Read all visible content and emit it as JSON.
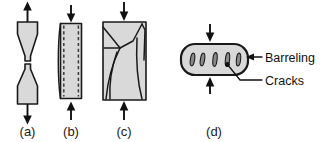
{
  "figure": {
    "background_color": "#ffffff",
    "specimen_fill_color": "#d9d9d9",
    "outline_color": "#1a1a1a",
    "crack_shade_color": "#8a8a8a"
  },
  "panels": [
    {
      "id": "a",
      "caption": "(a)",
      "description": "Tensile specimen fractured into two cone-shaped halves (cup-and-cone necking fracture)",
      "load_direction": "tension",
      "arrow_count": 2
    },
    {
      "id": "b",
      "caption": "(b)",
      "description": "Compressed rectangular specimen showing barreling with dashed original outline",
      "load_direction": "compression",
      "arrow_count": 2
    },
    {
      "id": "c",
      "caption": "(c)",
      "description": "Compressed rectangular specimen with branching internal cracks",
      "load_direction": "compression",
      "arrow_count": 2
    },
    {
      "id": "d",
      "caption": "(d)",
      "description": "Horizontal barrelled cylindrical specimen with surface cracks",
      "load_direction": "compression",
      "arrow_count": 2
    }
  ],
  "annotations": {
    "barreling": {
      "label": "Barreling",
      "pointer": "arrow-left"
    },
    "cracks": {
      "label": "Cracks",
      "pointer": "leader-line"
    }
  }
}
